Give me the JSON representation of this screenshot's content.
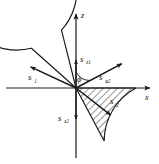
{
  "figure": {
    "background_color": "#ffffff",
    "stroke_color": "#1a1a1a",
    "hatch_color": "#1a1a1a",
    "axes": {
      "vertical_label": "z",
      "horizontal_label": "x",
      "origin_label": ""
    },
    "labels": {
      "s1": "s",
      "s1_sub": "1",
      "s2": "s",
      "s2_sub": "2",
      "sz1": "s",
      "sz1_sub": "z1",
      "sz2": "s",
      "sz2_sub": "z2",
      "sphi2": "s",
      "sphi2_sub": "φ2",
      "phi": "ϕ"
    },
    "geometry": {
      "center_x": 76,
      "center_y": 88,
      "radius": 60,
      "notch_start_deg": 104,
      "notch_end_deg": 138,
      "hatch_start_deg": -62,
      "hatch_end_deg": 0,
      "s1_angle_deg": 155,
      "s1_length": 50,
      "s2_angle_deg": -38,
      "s2_length": 44,
      "sphi2_angle_deg": 28,
      "sphi2_length": 52,
      "sz1_length": 30,
      "sz2_length": 32,
      "phi_arc_radius": 16
    }
  }
}
